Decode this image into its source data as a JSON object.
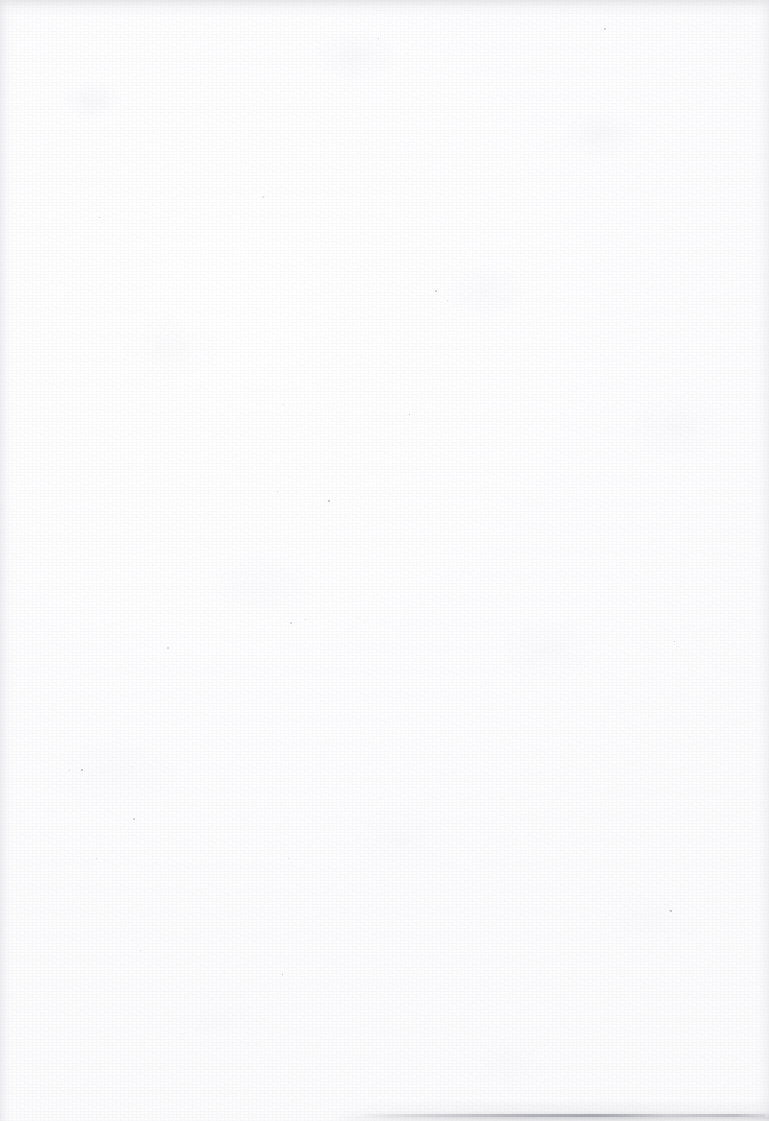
{
  "page": {
    "kind": "scanned-blank-page",
    "description": "Blank scanned page. No text, headings, figures, tables or UI elements are present.",
    "width_px": 769,
    "height_px": 1121,
    "background_color": "#fdfdfd",
    "text_content": "",
    "has_text": false
  },
  "artifacts": {
    "paper_grain": {
      "name": "paper-grain-texture",
      "present": true
    },
    "paper_mottle": {
      "name": "paper-mottle",
      "present": true
    },
    "top_edge_band": {
      "name": "top-edge-shading",
      "present": true,
      "approx_height_px": 16,
      "color": "#d6d6db"
    },
    "left_edge_gradient": {
      "name": "left-edge-shading",
      "present": true,
      "approx_width_px": 14,
      "color": "#dedee4"
    },
    "right_edge_gradient": {
      "name": "right-edge-shading",
      "present": true,
      "approx_width_px": 16,
      "color": "#e2e2e8"
    },
    "bottom_edge_shadow": {
      "name": "bottom-page-edge-shadow",
      "present": true,
      "x_start_px": 340,
      "x_end_px": 769,
      "strongest_x_range": "560-640",
      "color": "#8e8e98"
    },
    "dust_specks": [
      {
        "x": 262,
        "y": 196,
        "size": 2
      },
      {
        "x": 99,
        "y": 217,
        "size": 1
      },
      {
        "x": 435,
        "y": 290,
        "size": 2
      },
      {
        "x": 604,
        "y": 28,
        "size": 2
      },
      {
        "x": 378,
        "y": 38,
        "size": 1
      },
      {
        "x": 283,
        "y": 404,
        "size": 1
      },
      {
        "x": 328,
        "y": 500,
        "size": 2
      },
      {
        "x": 409,
        "y": 414,
        "size": 1
      },
      {
        "x": 277,
        "y": 491,
        "size": 1
      },
      {
        "x": 290,
        "y": 622,
        "size": 2
      },
      {
        "x": 167,
        "y": 647,
        "size": 2
      },
      {
        "x": 305,
        "y": 619,
        "size": 1
      },
      {
        "x": 81,
        "y": 769,
        "size": 2
      },
      {
        "x": 69,
        "y": 770,
        "size": 1
      },
      {
        "x": 133,
        "y": 818,
        "size": 2
      },
      {
        "x": 96,
        "y": 858,
        "size": 1
      },
      {
        "x": 288,
        "y": 858,
        "size": 1
      },
      {
        "x": 670,
        "y": 910,
        "size": 2
      },
      {
        "x": 282,
        "y": 974,
        "size": 1
      },
      {
        "x": 674,
        "y": 641,
        "size": 1
      },
      {
        "x": 669,
        "y": 910,
        "size": 1
      },
      {
        "x": 447,
        "y": 300,
        "size": 1
      },
      {
        "x": 140,
        "y": 950,
        "size": 1
      }
    ]
  }
}
